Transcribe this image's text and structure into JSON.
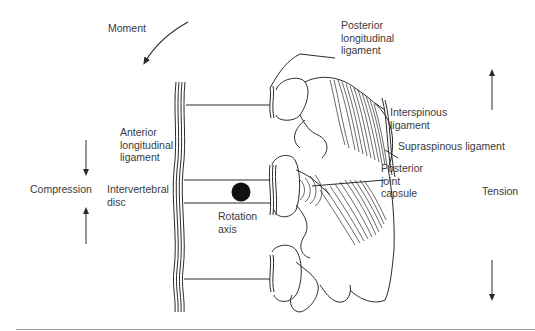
{
  "figure": {
    "type": "biomechanics diagram",
    "labels": {
      "moment": "Moment",
      "posterior_longitudinal_ligament": "Posterior\nlongitudinal\nligament",
      "interspinous_ligament": "Interspinous\nligament",
      "supraspinous_ligament": "Supraspinous ligament",
      "anterior_longitudinal_ligament": "Anterior\nlongitudinal\nligament",
      "compression": "Compression",
      "intervertebral_disc": "Intervertebral\ndisc",
      "posterior_joint_capsule": "Posterior\njoint\ncapsule",
      "tension": "Tension",
      "rotation_axis": "Rotation\naxis"
    },
    "arrows": {
      "moment": "curved arrow pointing down-left",
      "compression": [
        "down arrow above label",
        "up arrow below label"
      ],
      "tension": [
        "up arrow above label",
        "down arrow below label"
      ]
    },
    "colors": {
      "line": "#2a2a2a",
      "text": "#3a3a3a",
      "rotation_axis_fill": "#111111",
      "rule": "#9a9a9a"
    }
  }
}
